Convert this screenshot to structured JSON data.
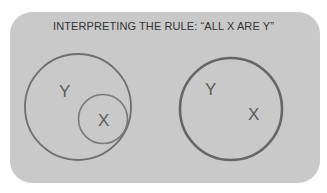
{
  "slide": {
    "title": "INTERPRETING THE RULE: “ALL X ARE Y”",
    "background_color": "#c9c9c9",
    "stroke_color": "#6e6e6e"
  },
  "diagrams": [
    {
      "name": "subset-venn",
      "outer_label": "Y",
      "inner_label": "X"
    },
    {
      "name": "equal-sets-venn",
      "label_1": "Y",
      "label_2": "X"
    }
  ]
}
